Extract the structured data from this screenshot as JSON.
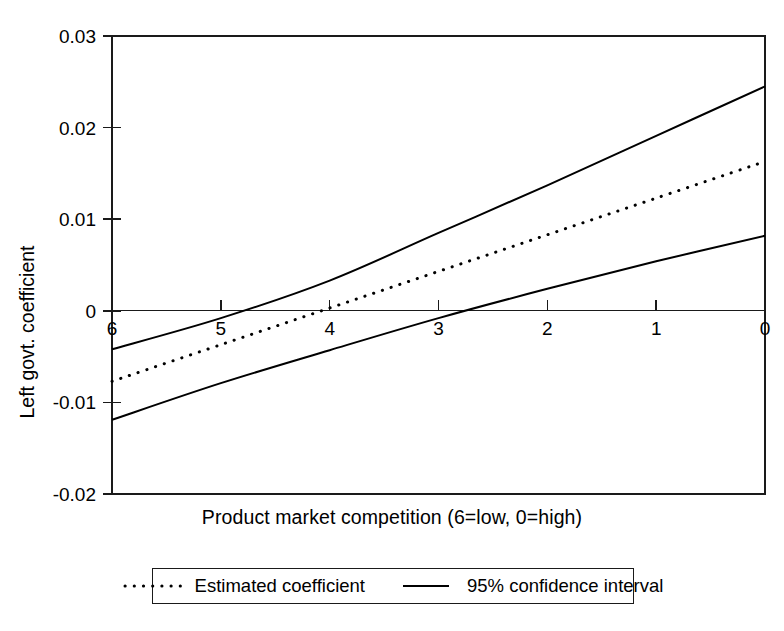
{
  "chart_data": {
    "type": "line",
    "title": "",
    "xlabel": "Product market competition (6=low, 0=high)",
    "ylabel": "Left govt. coefficient",
    "xlim": [
      6,
      0
    ],
    "ylim": [
      -0.02,
      0.03
    ],
    "x_ticks": [
      "6",
      "5",
      "4",
      "3",
      "2",
      "1",
      "0"
    ],
    "x_tick_values": [
      6,
      5,
      4,
      3,
      2,
      1,
      0
    ],
    "y_ticks": [
      "0.03",
      "0.02",
      "0.01",
      "0",
      "-0.01",
      "-0.02"
    ],
    "y_tick_values": [
      0.03,
      0.02,
      0.01,
      0,
      -0.01,
      -0.02
    ],
    "grid": false,
    "zero_line": true,
    "x_axis_direction": "descending",
    "legend_position": "below-plot",
    "x": [
      6,
      5,
      4,
      3,
      2,
      1,
      0
    ],
    "series": [
      {
        "name": "Estimated coefficient",
        "style": "dotted",
        "color": "#000000",
        "values": [
          -0.0077,
          -0.0037,
          0.0003,
          0.0043,
          0.0083,
          0.0123,
          0.0163
        ]
      },
      {
        "name": "95% confidence interval upper",
        "style": "solid",
        "color": "#000000",
        "values": [
          -0.0042,
          -0.0008,
          0.0033,
          0.0085,
          0.0137,
          0.0191,
          0.0245
        ]
      },
      {
        "name": "95% confidence interval lower",
        "style": "solid",
        "color": "#000000",
        "values": [
          -0.0119,
          -0.0079,
          -0.0043,
          -0.0008,
          0.0024,
          0.0054,
          0.0082
        ]
      }
    ],
    "legend": [
      {
        "label": "Estimated coefficient",
        "style": "dotted"
      },
      {
        "label": "95% confidence interval",
        "style": "solid"
      }
    ]
  },
  "colors": {
    "ink": "#000000",
    "axis": "#1a1a1a",
    "background": "#ffffff"
  }
}
